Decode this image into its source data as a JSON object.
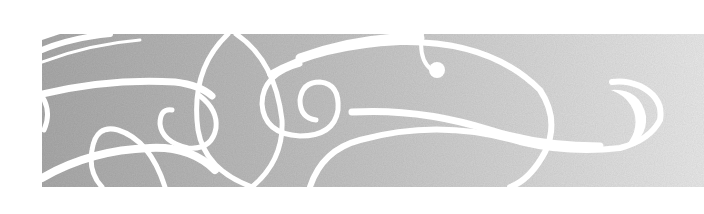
{
  "banner": {
    "description": "decorative-swirl-banner",
    "colors": {
      "page_background": "#ffffff",
      "band_left": "#a9a9a9",
      "band_mid": "#c4c4c4",
      "band_right": "#e6e6e6",
      "swirl": "#ffffff"
    },
    "band": {
      "x": 42,
      "y": 34,
      "width": 662,
      "height": 153
    }
  }
}
